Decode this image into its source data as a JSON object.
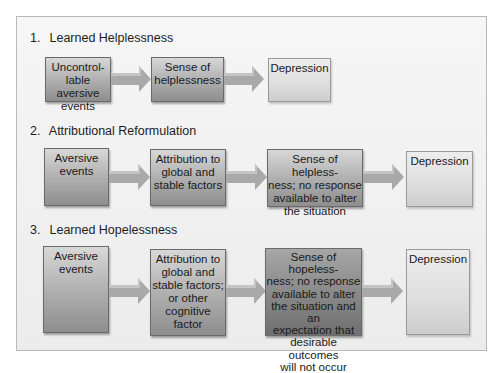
{
  "diagram": {
    "sections": [
      {
        "number": "1.",
        "title": "Learned Helplessness",
        "boxes": [
          {
            "text": "Uncontrol- lable aversive events",
            "lines": [
              "Uncontrol-",
              "lable aversive",
              "events"
            ]
          },
          {
            "text": "Sense of helplessness",
            "lines": [
              "Sense of",
              "helplessness"
            ]
          },
          {
            "text": "Depression",
            "lines": [
              "Depression"
            ]
          }
        ]
      },
      {
        "number": "2.",
        "title": "Attributional Reformulation",
        "boxes": [
          {
            "text": "Aversive events",
            "lines": [
              "Aversive",
              "events"
            ]
          },
          {
            "text": "Attribution to global and stable factors",
            "lines": [
              "Attribution to",
              "global and",
              "stable factors"
            ]
          },
          {
            "text": "Sense of helplessness; no response available to alter the situation",
            "lines": [
              "Sense of helpless-",
              "ness; no response",
              "available to alter",
              "the situation"
            ]
          },
          {
            "text": "Depression",
            "lines": [
              "Depression"
            ]
          }
        ]
      },
      {
        "number": "3.",
        "title": "Learned Hopelessness",
        "boxes": [
          {
            "text": "Aversive events",
            "lines": [
              "Aversive",
              "events"
            ]
          },
          {
            "text": "Attribution to global and stable factors; or other cognitive factor",
            "lines": [
              "Attribution to",
              "global and",
              "stable factors;",
              "or other",
              "cognitive",
              "factor"
            ]
          },
          {
            "text": "Sense of hopelessness; no response available to alter the situation and an expectation that desirable outcomes will not occur",
            "lines": [
              "Sense of hopeless-",
              "ness; no response",
              "available to alter",
              "the situation and an",
              "expectation that",
              "desirable outcomes",
              "will not occur"
            ]
          },
          {
            "text": "Depression",
            "lines": [
              "Depression"
            ]
          }
        ]
      }
    ]
  },
  "colors": {
    "frame_border": "#b9b9b9",
    "arrow_fill": "#a9a9a9",
    "arrow_highlight": "#c4c4c4"
  }
}
